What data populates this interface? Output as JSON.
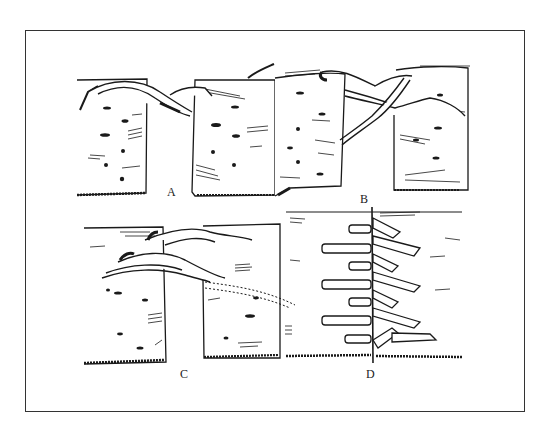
{
  "figure": {
    "panels": [
      {
        "id": "A",
        "label": "A"
      },
      {
        "id": "B",
        "label": "B"
      },
      {
        "id": "C",
        "label": "C"
      },
      {
        "id": "D",
        "label": "D"
      }
    ],
    "colors": {
      "ink": "#1a1a1a",
      "paper": "#ffffff",
      "frame": "#333333"
    }
  }
}
